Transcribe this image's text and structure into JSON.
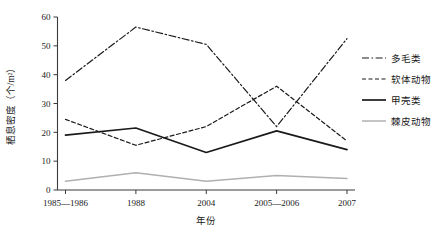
{
  "chart_data": {
    "type": "line",
    "title": "",
    "xlabel": "年份",
    "ylabel": "栖息密度（个/m²）",
    "categories": [
      "1985—1986",
      "1988",
      "2004",
      "2005—2006",
      "2007"
    ],
    "ylim": [
      0,
      60
    ],
    "yticks": [
      0,
      10,
      20,
      30,
      40,
      50,
      60
    ],
    "ytick_labels": [
      "0",
      "10",
      "20",
      "30",
      "40",
      "50",
      "60"
    ],
    "grid": false,
    "legend_position": "right",
    "series": [
      {
        "name": "多毛类",
        "style": "dash-dot",
        "color": "#1a1a1a",
        "values": [
          38,
          56.5,
          50.5,
          22,
          52.5
        ]
      },
      {
        "name": "软体动物",
        "style": "dotted",
        "color": "#1a1a1a",
        "values": [
          24.5,
          15.5,
          22,
          36,
          17
        ]
      },
      {
        "name": "甲壳类",
        "style": "solid",
        "color": "#1a1a1a",
        "values": [
          19,
          21.5,
          13,
          20.5,
          14
        ]
      },
      {
        "name": "棘皮动物",
        "style": "solid-gray",
        "color": "#b0b0b0",
        "values": [
          3,
          6,
          3,
          5,
          4
        ]
      }
    ]
  }
}
